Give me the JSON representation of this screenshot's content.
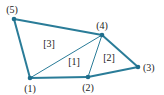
{
  "diagram": {
    "colors": {
      "edge": "#2a7c98",
      "node": "#1f6e8c",
      "text": "#222222"
    },
    "nodes": [
      {
        "id": "1",
        "label": "(1)",
        "x": 30,
        "y": 78
      },
      {
        "id": "2",
        "label": "(2)",
        "x": 88,
        "y": 77
      },
      {
        "id": "3",
        "label": "(3)",
        "x": 138,
        "y": 67
      },
      {
        "id": "4",
        "label": "(4)",
        "x": 102,
        "y": 35
      },
      {
        "id": "5",
        "label": "(5)",
        "x": 14,
        "y": 19
      }
    ],
    "elements": [
      {
        "id": "1",
        "label": "[1]",
        "nodes": [
          "1",
          "2",
          "4"
        ]
      },
      {
        "id": "2",
        "label": "[2]",
        "nodes": [
          "2",
          "3",
          "4"
        ]
      },
      {
        "id": "3",
        "label": "[3]",
        "nodes": [
          "1",
          "4",
          "5"
        ]
      }
    ]
  }
}
